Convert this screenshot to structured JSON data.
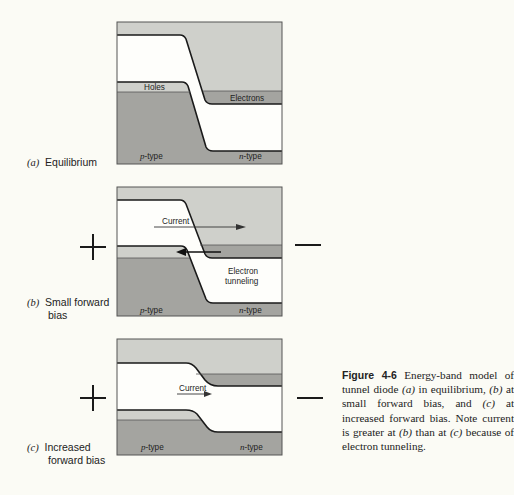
{
  "figure": {
    "number": "Figure 4-6",
    "caption_text": "Energy-band model of tunnel diode (a) in equilibrium, (b) at small forward bias, and (c) at increased forward bias. Note current is greater at (b) than at (c) because of electron tunneling.",
    "caption_parts": {
      "p1": " Energy-band model of tunnel diode ",
      "a": "(a)",
      "p2": " in equilibrium, ",
      "b": "(b)",
      "p3": " at small forward bias, and ",
      "c": "(c)",
      "p4": " at increased forward bias. Note current is greater at ",
      "b2": "(b)",
      "p5": " than at ",
      "c2": "(c)",
      "p6": " because of electron tunneling."
    }
  },
  "panels": {
    "a": {
      "tag": "(a)",
      "label": "Equilibrium",
      "holes_label": "Holes",
      "electrons_label": "Electrons",
      "p_label": "p",
      "p_suffix": "-type",
      "n_label": "n",
      "n_suffix": "-type"
    },
    "b": {
      "tag": "(b)",
      "label_line1": "Small forward",
      "label_line2": "bias",
      "plus": "+",
      "minus": "—",
      "current_label": "Current",
      "tunneling_line1": "Electron",
      "tunneling_line2": "tunneling",
      "p_label": "p",
      "p_suffix": "-type",
      "n_label": "n",
      "n_suffix": "-type"
    },
    "c": {
      "tag": "(c)",
      "label_line1": "Increased",
      "label_line2": "forward bias",
      "plus": "+",
      "minus": "—",
      "current_label": "Current",
      "p_label": "p",
      "p_suffix": "-type",
      "n_label": "n",
      "n_suffix": "-type"
    }
  },
  "colors": {
    "background": "#fbfbf5",
    "light_band": "#cfd0cb",
    "filled_band": "#a4a4a0",
    "gap": "#fefefb",
    "line": "#1a1a1a"
  }
}
